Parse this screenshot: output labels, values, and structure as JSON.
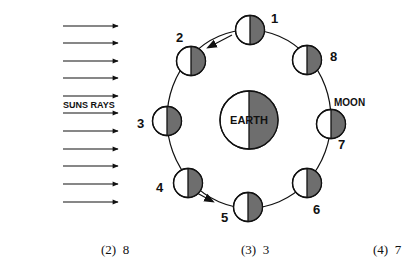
{
  "diagram": {
    "sun_label": "SUNS RAYS",
    "earth_label": "EARTH",
    "moon_label": "MOON",
    "ray_count": 11,
    "moons": [
      {
        "id": "1",
        "label": "1"
      },
      {
        "id": "2",
        "label": "2"
      },
      {
        "id": "3",
        "label": "3"
      },
      {
        "id": "4",
        "label": "4"
      },
      {
        "id": "5",
        "label": "5"
      },
      {
        "id": "6",
        "label": "6"
      },
      {
        "id": "7",
        "label": "7"
      },
      {
        "id": "8",
        "label": "8"
      }
    ],
    "colors": {
      "shade": "#6e6e6e",
      "line": "#111111",
      "light": "#ffffff"
    }
  },
  "answers": [
    {
      "label": "(2)  8"
    },
    {
      "label": "(3)  3"
    },
    {
      "label": "(4)  7"
    }
  ]
}
